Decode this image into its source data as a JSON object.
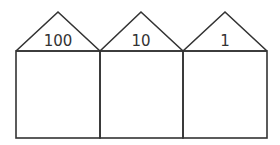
{
  "diagram": {
    "houses": [
      {
        "label": "100",
        "place": "hundreds"
      },
      {
        "label": "10",
        "place": "tens"
      },
      {
        "label": "1",
        "place": "ones"
      }
    ],
    "stroke_color": "#333333",
    "background": "#ffffff"
  }
}
